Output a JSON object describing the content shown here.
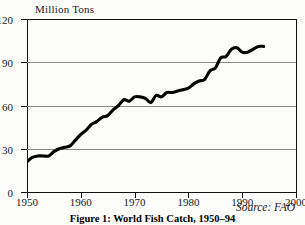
{
  "figure": {
    "caption": "Figure 1: World Fish Catch, 1950–94",
    "source_note": "Source: FAO"
  },
  "chart_data": {
    "type": "line",
    "title": "",
    "subtitle": "",
    "xlabel": "",
    "ylabel": "Million Tons",
    "xlim": [
      1950,
      2000
    ],
    "ylim": [
      0,
      120
    ],
    "xticks": [
      1950,
      1960,
      1970,
      1980,
      1990,
      2000
    ],
    "yticks": [
      0,
      30,
      60,
      90,
      120
    ],
    "xtick_labels": [
      "1950",
      "1960",
      "1970",
      "1980",
      "1990",
      "2000"
    ],
    "ytick_labels": [
      "0",
      "30",
      "60",
      "90",
      "120"
    ],
    "grid": "horizontal",
    "legend": "none",
    "annotations": [
      "Source: FAO"
    ],
    "series": [
      {
        "name": "World Fish Catch",
        "color": "#000000",
        "x": [
          1950,
          1951,
          1952,
          1953,
          1954,
          1955,
          1956,
          1957,
          1958,
          1959,
          1960,
          1961,
          1962,
          1963,
          1964,
          1965,
          1966,
          1967,
          1968,
          1969,
          1970,
          1971,
          1972,
          1973,
          1974,
          1975,
          1976,
          1977,
          1978,
          1979,
          1980,
          1981,
          1982,
          1983,
          1984,
          1985,
          1986,
          1987,
          1988,
          1989,
          1990,
          1991,
          1992,
          1993,
          1994
        ],
        "values": [
          21,
          24,
          25,
          25,
          25,
          28,
          30,
          31,
          32,
          36,
          40,
          43,
          47,
          49,
          52,
          53,
          57,
          60,
          64,
          63,
          66,
          66,
          65,
          62,
          67,
          66,
          69,
          69,
          70,
          71,
          72,
          75,
          77,
          78,
          84,
          86,
          93,
          94,
          99,
          100,
          97,
          97,
          99,
          101,
          101
        ]
      }
    ]
  }
}
